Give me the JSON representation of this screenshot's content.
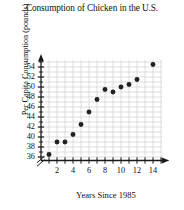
{
  "chart_data": {
    "type": "scatter",
    "title": "Consumption of Chicken in the U.S.",
    "xlabel": "Years Since 1985",
    "ylabel": "Per Capita Consumption (pounds)",
    "x": [
      1,
      2,
      3,
      4,
      5,
      6,
      7,
      8,
      9,
      10,
      11,
      12,
      14
    ],
    "values": [
      36.5,
      39,
      39,
      40.5,
      42.5,
      45,
      47.5,
      49.5,
      49,
      50,
      50.5,
      51.5,
      54.5
    ],
    "points": [
      {
        "x": 1,
        "y": 36.5
      },
      {
        "x": 2,
        "y": 39
      },
      {
        "x": 3,
        "y": 39
      },
      {
        "x": 4,
        "y": 40.5
      },
      {
        "x": 5,
        "y": 42.5
      },
      {
        "x": 6,
        "y": 45
      },
      {
        "x": 7,
        "y": 47.5
      },
      {
        "x": 8,
        "y": 49.5
      },
      {
        "x": 9,
        "y": 49
      },
      {
        "x": 10,
        "y": 50
      },
      {
        "x": 11,
        "y": 50.5
      },
      {
        "x": 12,
        "y": 51.5
      },
      {
        "x": 14,
        "y": 54.5
      }
    ],
    "xlim": [
      0,
      15
    ],
    "ylim": [
      35,
      55.5
    ],
    "xticks": [
      1,
      2,
      3,
      4,
      5,
      6,
      7,
      8,
      9,
      10,
      11,
      12,
      13,
      14,
      15
    ],
    "xtick_labels": [
      "2",
      "4",
      "6",
      "8",
      "10",
      "12",
      "14"
    ],
    "xtick_label_values": [
      2,
      4,
      6,
      8,
      10,
      12,
      14
    ],
    "yticks": [
      36,
      37,
      38,
      39,
      40,
      41,
      42,
      43,
      44,
      45,
      46,
      47,
      48,
      49,
      50,
      51,
      52,
      53,
      54,
      55
    ],
    "ytick_labels": [
      "36",
      "38",
      "40",
      "42",
      "44",
      "46",
      "48",
      "50",
      "52",
      "54"
    ],
    "ytick_label_values": [
      36,
      38,
      40,
      42,
      44,
      46,
      48,
      50,
      52,
      54
    ],
    "grid": true,
    "legend": "none",
    "axis_break_y": true,
    "marker_color": "#222222",
    "grid_color": "#cfcfcf",
    "axis_color": "#1a1a1a"
  },
  "axes": {
    "y_break_symbol": "axis-break"
  }
}
